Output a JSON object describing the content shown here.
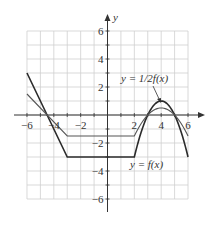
{
  "chart_data": {
    "type": "line",
    "title": "",
    "xlabel": "",
    "ylabel": "y",
    "xlim": [
      -6,
      6
    ],
    "ylim": [
      -6,
      6
    ],
    "grid": true,
    "x_ticks": [
      -6,
      -4,
      -2,
      2,
      4,
      6
    ],
    "x_tick_labels": [
      "−6",
      "−4",
      "−2",
      "2",
      "4",
      "6"
    ],
    "y_ticks": [
      6,
      4,
      2,
      -2,
      -4,
      -6
    ],
    "y_tick_labels": [
      "6",
      "4",
      "2",
      "−2",
      "−4",
      "−6"
    ],
    "series": [
      {
        "name": "y = f(x)",
        "color": "#2b2b2b",
        "points": [
          [
            -6,
            3
          ],
          [
            -3,
            -3
          ],
          [
            2,
            -3
          ],
          [
            3,
            0
          ],
          [
            4,
            1
          ],
          [
            5,
            0
          ],
          [
            6,
            -3
          ]
        ]
      },
      {
        "name": "y = 1/2f(x)",
        "color": "#555555",
        "points": [
          [
            -6,
            1.5
          ],
          [
            -3,
            -1.5
          ],
          [
            2,
            -1.5
          ],
          [
            3,
            0
          ],
          [
            4,
            0.5
          ],
          [
            5,
            0
          ],
          [
            6,
            -1.5
          ]
        ]
      }
    ],
    "annotations": [
      {
        "text": "y = 1/2f(x)",
        "x": 3.9,
        "y": 2.3,
        "arrow_to": [
          4,
          0.8
        ]
      },
      {
        "text": "y = f(x)",
        "x": 3.6,
        "y": -3.5
      }
    ]
  },
  "labels": {
    "y_axis": "y",
    "half_label": "y = 1/2f(x)",
    "f_label": "y = f(x)",
    "xt": [
      "−6",
      "−4",
      "−2",
      "2",
      "4",
      "6"
    ],
    "yt": [
      "6",
      "4",
      "2",
      "−2",
      "−4",
      "−6"
    ]
  }
}
